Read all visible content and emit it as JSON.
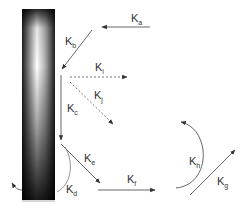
{
  "diagram": {
    "type": "rate-constant-scheme",
    "surface": {
      "description": "vertical gradient bar (dark edges, bright center near top)",
      "colors": {
        "dark": "#1a1a1a",
        "light": "#ffffff"
      }
    },
    "labels": {
      "a": {
        "base": "K",
        "sub": "a"
      },
      "b": {
        "base": "K",
        "sub": "b"
      },
      "c": {
        "base": "K",
        "sub": "c"
      },
      "d": {
        "base": "K",
        "sub": "d"
      },
      "e": {
        "base": "K",
        "sub": "e"
      },
      "f": {
        "base": "K",
        "sub": "f"
      },
      "g": {
        "base": "K",
        "sub": "g"
      },
      "h": {
        "base": "K",
        "sub": "h"
      },
      "i": {
        "base": "K",
        "sub": "i"
      },
      "j": {
        "base": "K",
        "sub": "j"
      }
    },
    "arrows": [
      {
        "label": "K_a",
        "style": "solid",
        "direction": "right-to-left, toward Kb start"
      },
      {
        "label": "K_b",
        "style": "solid",
        "direction": "diagonal down-left to surface"
      },
      {
        "label": "K_c",
        "style": "solid",
        "direction": "down along surface"
      },
      {
        "label": "K_d",
        "style": "solid-arc",
        "direction": "curved around bottom of surface, up-left"
      },
      {
        "label": "K_e",
        "style": "solid",
        "direction": "diagonal down-right away from surface"
      },
      {
        "label": "K_f",
        "style": "solid",
        "direction": "left-to-right along bottom"
      },
      {
        "label": "K_g",
        "style": "solid",
        "direction": "diagonal up-right"
      },
      {
        "label": "K_h",
        "style": "solid-arc",
        "direction": "curved counterclockwise, upward-left"
      },
      {
        "label": "K_i",
        "style": "dashed",
        "direction": "horizontal right"
      },
      {
        "label": "K_j",
        "style": "dashed",
        "direction": "diagonal down-right"
      }
    ],
    "colors": {
      "line": "#555555",
      "dashed": "#666666",
      "text": "#333333"
    }
  }
}
